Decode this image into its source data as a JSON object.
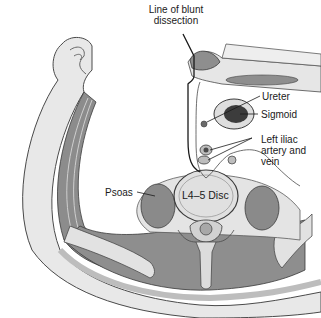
{
  "figure": {
    "labels": {
      "blunt_dissection": [
        "Line of blunt",
        "dissection"
      ],
      "ureter": "Ureter",
      "sigmoid": "Sigmoid",
      "iliac": [
        "Left iliac",
        "artery and",
        "vein"
      ],
      "psoas": "Psoas",
      "disc": "L4–5 Disc"
    },
    "colors": {
      "muscle": "#8a8a8a",
      "muscle_light": "#a8a8a8",
      "fat": "#e6e6e6",
      "bone": "#d6d6d6",
      "outline": "#3a3a3a",
      "lumen": "#3c3c3c"
    }
  }
}
